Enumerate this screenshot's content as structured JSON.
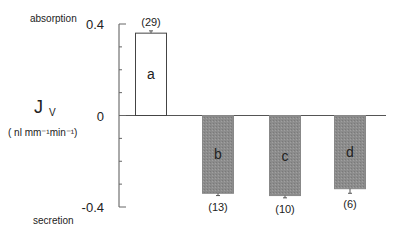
{
  "chart_data": {
    "type": "bar",
    "title": "",
    "xlabel": "",
    "ylabel": "Jv",
    "ylabel_main": "J",
    "ylabel_sub": "V",
    "yunits": "( nl  mm⁻¹min⁻¹)",
    "ylim": [
      -0.4,
      0.4
    ],
    "yticks": [
      0.4,
      0,
      -0.4
    ],
    "ytick_labels": [
      "0.4",
      "0",
      "-0.4"
    ],
    "minor_tick_step": 0.1,
    "top_annotation": "absorption",
    "bottom_annotation": "secretion",
    "grid": false,
    "categories": [
      "a",
      "b",
      "c",
      "d"
    ],
    "values": [
      0.36,
      -0.34,
      -0.35,
      -0.32
    ],
    "errors": [
      0.01,
      0.01,
      0.01,
      0.02
    ],
    "n_labels": [
      "(29)",
      "(13)",
      "(10)",
      "(6)"
    ],
    "bar_styles": [
      "open",
      "shaded",
      "shaded",
      "shaded"
    ],
    "colors": {
      "open": "#ffffff",
      "shaded": "#8c8c8c",
      "stroke": "#444444"
    }
  }
}
